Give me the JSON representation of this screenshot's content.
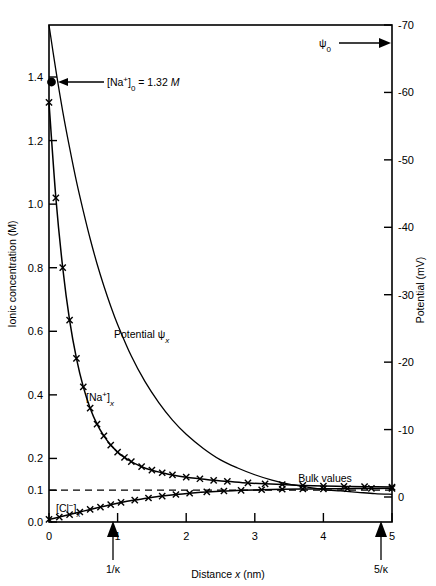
{
  "chart_data": {
    "type": "line",
    "title": "",
    "xlabel": "Distance x (nm)",
    "ylabel": "Ionic concentration (M)",
    "y2label": "Potential (mV)",
    "xlim": [
      0,
      5
    ],
    "ylim": [
      0.0,
      1.4
    ],
    "y2lim": [
      0,
      -70
    ],
    "grid": false,
    "legend_position": "inline-curve-labels",
    "x_ticks": [
      "0",
      "1",
      "2",
      "3",
      "4",
      "5"
    ],
    "x_tick_values": [
      0,
      1,
      2,
      3,
      4,
      5
    ],
    "y_ticks": [
      "0.0",
      "0.1",
      "0.2",
      "0.4",
      "0.6",
      "0.8",
      "1.0",
      "1.2",
      "1.4"
    ],
    "y_tick_values": [
      0.0,
      0.1,
      0.2,
      0.4,
      0.6,
      0.8,
      1.0,
      1.2,
      1.4
    ],
    "y2_ticks": [
      "0",
      "-10",
      "-20",
      "-30",
      "-40",
      "-50",
      "-60",
      "-70"
    ],
    "y2_tick_values": [
      0,
      -10,
      -20,
      -30,
      -40,
      -50,
      -60,
      -70
    ],
    "series": [
      {
        "name": "Potential psi_x",
        "label": "Potential ψ",
        "label_sub": "x",
        "axis": "right",
        "markers": false,
        "x": [
          0,
          0.1,
          0.2,
          0.3,
          0.4,
          0.5,
          0.6,
          0.7,
          0.8,
          0.9,
          1.0,
          1.2,
          1.4,
          1.6,
          1.8,
          2.0,
          2.25,
          2.5,
          2.75,
          3.0,
          3.25,
          3.5,
          3.75,
          4.0,
          4.25,
          4.5,
          4.75,
          5.0
        ],
        "y": [
          -70.0,
          -63.3,
          -57.2,
          -51.8,
          -46.8,
          -42.4,
          -38.3,
          -34.6,
          -31.3,
          -28.3,
          -25.6,
          -20.9,
          -17.1,
          -14.0,
          -11.4,
          -9.3,
          -7.2,
          -5.5,
          -4.3,
          -3.3,
          -2.5,
          -1.9,
          -1.5,
          -1.1,
          -0.9,
          -0.7,
          -0.5,
          -0.4
        ]
      },
      {
        "name": "Sodium concentration [Na+]_x",
        "label": "[Na",
        "label_sup": "+",
        "label_close": "]",
        "label_sub": "x",
        "axis": "left",
        "markers": true,
        "marker_symbol": "x",
        "x": [
          0,
          0.1,
          0.2,
          0.3,
          0.4,
          0.5,
          0.6,
          0.7,
          0.8,
          0.9,
          1.0,
          1.1,
          1.2,
          1.35,
          1.5,
          1.65,
          1.8,
          2.0,
          2.2,
          2.4,
          2.6,
          2.9,
          3.15,
          3.4,
          3.7,
          4.0,
          4.3,
          4.6,
          5.0
        ],
        "y": [
          1.32,
          1.02,
          0.8,
          0.635,
          0.515,
          0.425,
          0.358,
          0.308,
          0.271,
          0.242,
          0.22,
          0.203,
          0.19,
          0.174,
          0.163,
          0.155,
          0.148,
          0.141,
          0.136,
          0.131,
          0.128,
          0.123,
          0.12,
          0.118,
          0.115,
          0.113,
          0.112,
          0.111,
          0.11
        ],
        "start_value": 1.32
      },
      {
        "name": "Chloride concentration [Cl-]_x",
        "label": "[Cl",
        "label_sup": "−",
        "label_close": "]",
        "label_sub": "x",
        "axis": "left",
        "markers": true,
        "marker_symbol": "x",
        "x": [
          0,
          0.15,
          0.3,
          0.45,
          0.6,
          0.75,
          0.9,
          1.05,
          1.25,
          1.45,
          1.65,
          1.85,
          2.05,
          2.3,
          2.55,
          2.8,
          3.1,
          3.4,
          3.7,
          4.0,
          4.35,
          4.7,
          5.0
        ],
        "y": [
          0.008,
          0.0155,
          0.0235,
          0.0315,
          0.0395,
          0.047,
          0.0545,
          0.0615,
          0.069,
          0.0755,
          0.0815,
          0.0865,
          0.0905,
          0.0945,
          0.0975,
          0.0995,
          0.1015,
          0.103,
          0.104,
          0.1045,
          0.105,
          0.1055,
          0.106
        ]
      }
    ],
    "reference_line": {
      "name": "bulk-value-dashed-line",
      "y": 0.1,
      "style": "dashed"
    },
    "annotations": {
      "na_zero": {
        "text_open": "[Na",
        "text_sup": "+",
        "text_close": "]",
        "text_sub": "0",
        "text_eq": " = 1.32 ",
        "text_unit": "M",
        "point_x": 0,
        "point_y": 1.32
      },
      "psi_zero": {
        "text": "ψ",
        "text_sub": "0"
      },
      "bulk_values": {
        "text": "Bulk  values"
      },
      "kappa_1": {
        "text_num": "1/",
        "text_kappa": "κ",
        "x": 0.93
      },
      "kappa_5": {
        "text_num": "5/",
        "text_kappa": "κ",
        "x": 4.85
      }
    }
  },
  "accent_color": "#000000",
  "background_color": "#ffffff"
}
